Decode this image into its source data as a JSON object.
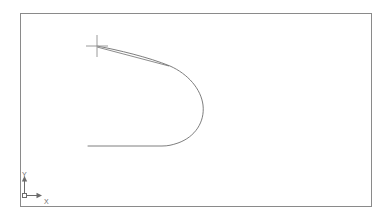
{
  "app": {
    "title": "CAD Drawing Area",
    "background_color": "#ffffff"
  },
  "viewport": {
    "name": "model-space-viewport",
    "border_color": "#8a8a8a",
    "border_width": 1,
    "bounds": {
      "x": 20,
      "y": 13,
      "width": 352,
      "height": 194
    }
  },
  "ucs_icon": {
    "name": "ucs-icon",
    "color": "#6b6b6b",
    "origin": {
      "x": 25,
      "y": 196
    },
    "y_axis_label": "Y",
    "x_axis_label": "X",
    "y_axis_length": 22,
    "x_axis_length": 18
  },
  "cursor": {
    "name": "crosshair-cursor",
    "color": "#9a9a9a",
    "x": 97,
    "y": 46,
    "arm_length": 11
  },
  "geometry": {
    "stroke_color": "#6f6f6f",
    "stroke_width": 0.8,
    "entities": [
      {
        "name": "spline-u-curve",
        "type": "spline",
        "description": "Horseshoe / U shaped open curve, open toward the left",
        "points": [
          [
            97,
            46
          ],
          [
            120,
            52
          ],
          [
            150,
            59
          ],
          [
            172,
            68
          ],
          [
            192,
            82
          ],
          [
            203,
            101
          ],
          [
            204,
            118
          ],
          [
            196,
            134
          ],
          [
            180,
            143
          ],
          [
            163,
            146
          ],
          [
            88,
            146
          ]
        ]
      },
      {
        "name": "rubber-band-line",
        "type": "line",
        "description": "Straight preview line from crosshair to curve",
        "start": [
          97,
          47
        ],
        "end": [
          168,
          66
        ]
      }
    ]
  }
}
